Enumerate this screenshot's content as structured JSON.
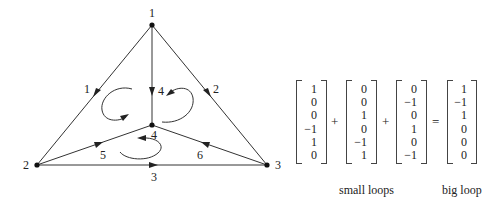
{
  "diagram": {
    "type": "directed graph with loops",
    "nodes": [
      {
        "id": "1",
        "label": "1",
        "x": 152,
        "y": 25,
        "lx": 152,
        "ly": 16
      },
      {
        "id": "2",
        "label": "2",
        "x": 37,
        "y": 165,
        "lx": 26,
        "ly": 169
      },
      {
        "id": "3",
        "label": "3",
        "x": 267,
        "y": 165,
        "lx": 277,
        "ly": 169
      },
      {
        "id": "4",
        "label": "4",
        "x": 152,
        "y": 125,
        "lx": 154,
        "ly": 139
      }
    ],
    "edges": [
      {
        "id": "1",
        "label": "1",
        "from": "1",
        "to": "2",
        "lx": 87,
        "ly": 93
      },
      {
        "id": "2",
        "label": "2",
        "from": "1",
        "to": "3",
        "lx": 216,
        "ly": 93
      },
      {
        "id": "3",
        "label": "3",
        "from": "2",
        "to": "3",
        "lx": 154,
        "ly": 181
      },
      {
        "id": "4",
        "label": "4",
        "from": "1",
        "to": "4",
        "lx": 160,
        "ly": 95
      },
      {
        "id": "5",
        "label": "5",
        "from": "2",
        "to": "4",
        "lx": 103,
        "ly": 159
      },
      {
        "id": "6",
        "label": "6",
        "from": "3",
        "to": "4",
        "lx": 200,
        "ly": 159
      }
    ],
    "loops": [
      "left-small-loop",
      "right-small-loop",
      "bottom-small-loop"
    ]
  },
  "equation": {
    "vectors": [
      {
        "name": "small-loop-1",
        "entries": [
          "1",
          "0",
          "0",
          "−1",
          "1",
          "0"
        ]
      },
      {
        "name": "small-loop-2",
        "entries": [
          "0",
          "0",
          "1",
          "0",
          "−1",
          "1"
        ]
      },
      {
        "name": "small-loop-3",
        "entries": [
          "0",
          "−1",
          "0",
          "1",
          "0",
          "−1"
        ]
      },
      {
        "name": "big-loop",
        "entries": [
          "1",
          "−1",
          "1",
          "0",
          "0",
          "0"
        ]
      }
    ],
    "operators": [
      "+",
      "+",
      "="
    ],
    "captions": {
      "small": "small loops",
      "big": "big loop"
    }
  }
}
